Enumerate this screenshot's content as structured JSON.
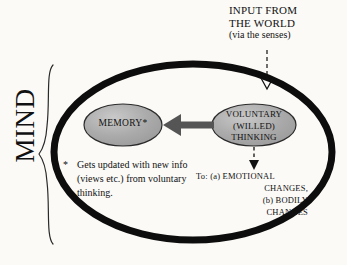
{
  "diagram": {
    "title_block": {
      "line1": "INPUT FROM",
      "line2": "THE WORLD",
      "line3": "(via the senses)"
    },
    "brace_label": "MIND",
    "nodes": [
      {
        "id": "memory",
        "label": "MEMORY*"
      },
      {
        "id": "voluntary-thinking",
        "label_line1": "VOLUNTARY",
        "label_line2": "(WILLED)",
        "label_line3": "THINKING"
      }
    ],
    "footnote": {
      "marker": "*",
      "text": "Gets updated with new info (views etc.) from voluntary thinking."
    },
    "outcomes": {
      "lead": "To:  (a) EMOTIONAL",
      "line2": "CHANGES,",
      "line3": "(b) BODILY",
      "line4": "CHANGES"
    },
    "colors": {
      "background": "#fbfaf7",
      "mind_boundary": "#0d0d0d",
      "node_fill": "#a8a8a8",
      "node_stroke": "#2b2b2b",
      "solid_arrow": "#555555",
      "dashed_arrow": "#111111",
      "text": "#111111"
    }
  }
}
